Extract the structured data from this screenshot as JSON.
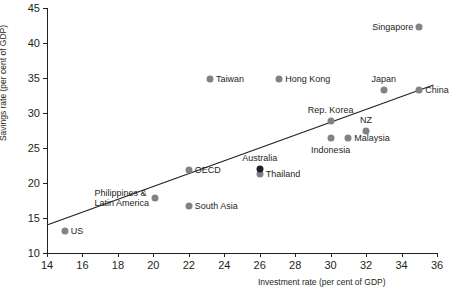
{
  "chart_data": {
    "type": "scatter",
    "title": "",
    "xlabel": "Investment rate (per cent of GDP)",
    "ylabel": "Savings rate (per cent of GDP)",
    "xlim": [
      14,
      36
    ],
    "ylim": [
      10,
      45
    ],
    "xticks": [
      14,
      16,
      18,
      20,
      22,
      24,
      26,
      28,
      30,
      32,
      34,
      36
    ],
    "yticks": [
      10,
      15,
      20,
      25,
      30,
      35,
      40,
      45
    ],
    "grid": false,
    "legend": "none",
    "marker_color": "#808285",
    "highlight_color": "#231f20",
    "trendline": {
      "label": "fitted trend line",
      "x": [
        14,
        35.8
      ],
      "y": [
        14.0,
        34.0
      ]
    },
    "points": [
      {
        "label": "US",
        "x": 15.0,
        "y": 13.2,
        "label_pos": "right",
        "dark": false
      },
      {
        "label": "Philippines &\nLatin America",
        "x": 20.1,
        "y": 17.9,
        "label_pos": "left",
        "dark": false
      },
      {
        "label": "South Asia",
        "x": 22.0,
        "y": 16.7,
        "label_pos": "right",
        "dark": false
      },
      {
        "label": "OECD",
        "x": 22.0,
        "y": 21.8,
        "label_pos": "right",
        "dark": false
      },
      {
        "label": "Taiwan",
        "x": 23.2,
        "y": 34.8,
        "label_pos": "right",
        "dark": false
      },
      {
        "label": "Australia",
        "x": 26.0,
        "y": 22.0,
        "label_pos": "above",
        "dark": true
      },
      {
        "label": "Thailand",
        "x": 26.0,
        "y": 21.3,
        "label_pos": "right",
        "dark": false
      },
      {
        "label": "Hong Kong",
        "x": 27.1,
        "y": 34.8,
        "label_pos": "right",
        "dark": false
      },
      {
        "label": "Rep. Korea",
        "x": 30.0,
        "y": 28.8,
        "label_pos": "above",
        "dark": false
      },
      {
        "label": "Indonesia",
        "x": 30.0,
        "y": 26.5,
        "label_pos": "below",
        "dark": false
      },
      {
        "label": "Malaysia",
        "x": 31.0,
        "y": 26.5,
        "label_pos": "right",
        "dark": false
      },
      {
        "label": "NZ",
        "x": 32.0,
        "y": 27.5,
        "label_pos": "above",
        "dark": false
      },
      {
        "label": "Japan",
        "x": 33.0,
        "y": 33.3,
        "label_pos": "above",
        "dark": false
      },
      {
        "label": "China",
        "x": 35.0,
        "y": 33.3,
        "label_pos": "right",
        "dark": false
      },
      {
        "label": "Singapore",
        "x": 35.0,
        "y": 42.3,
        "label_pos": "left",
        "dark": false
      }
    ]
  }
}
